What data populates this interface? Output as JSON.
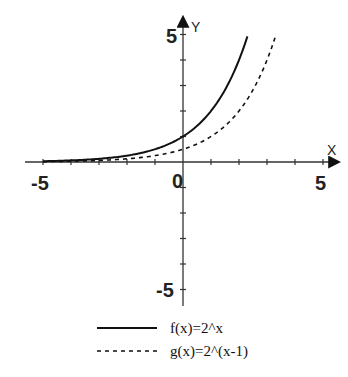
{
  "chart_data": {
    "type": "line",
    "title": "",
    "xlabel": "X",
    "ylabel": "Y",
    "xlim": [
      -5.5,
      5.6
    ],
    "ylim": [
      -5.6,
      5.4
    ],
    "x_ticks": [
      -5,
      -4,
      -3,
      -2,
      -1,
      0,
      1,
      2,
      3,
      4,
      5
    ],
    "y_ticks": [
      -5,
      -4,
      -3,
      -2,
      -1,
      1,
      2,
      3,
      4,
      5
    ],
    "x_tick_labels": {
      "-5": "-5",
      "0": "0",
      "5": "5"
    },
    "y_tick_labels": {
      "5": "5",
      "-5": "-5"
    },
    "grid": false,
    "legend_position": "bottom",
    "series": [
      {
        "name": "f(x)=2^x",
        "style": "solid",
        "x_range": [
          -5,
          2.3
        ],
        "points": [
          [
            -5,
            0.03
          ],
          [
            -4,
            0.06
          ],
          [
            -3,
            0.13
          ],
          [
            -2,
            0.25
          ],
          [
            -1,
            0.5
          ],
          [
            0,
            1
          ],
          [
            1,
            2
          ],
          [
            2,
            4
          ],
          [
            2.3,
            4.92
          ]
        ]
      },
      {
        "name": "g(x)=2^(x-1)",
        "style": "dashed",
        "x_range": [
          -5,
          3.3
        ],
        "points": [
          [
            -5,
            0.02
          ],
          [
            -4,
            0.03
          ],
          [
            -3,
            0.06
          ],
          [
            -2,
            0.13
          ],
          [
            -1,
            0.25
          ],
          [
            0,
            0.5
          ],
          [
            1,
            1
          ],
          [
            2,
            2
          ],
          [
            3,
            4
          ],
          [
            3.3,
            4.92
          ]
        ]
      }
    ]
  },
  "labels": {
    "x_axis": "X",
    "y_axis": "Y",
    "x_min_label": "-5",
    "x_origin_label": "0",
    "x_max_label": "5",
    "y_max_label": "5",
    "y_min_label": "-5"
  },
  "legend": {
    "items": [
      {
        "label": "f(x)=2^x",
        "style": "solid"
      },
      {
        "label": "g(x)=2^(x-1)",
        "style": "dashed"
      }
    ]
  },
  "colors": {
    "line": "#111111",
    "axis": "#333333"
  }
}
